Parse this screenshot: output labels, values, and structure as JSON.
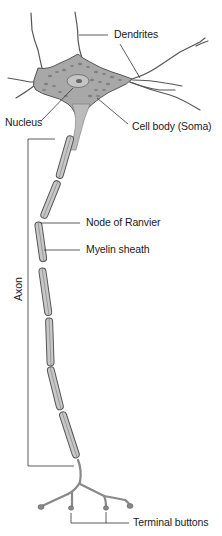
{
  "diagram": {
    "labels": {
      "dendrites": "Dendrites",
      "nucleus": "Nucleus",
      "cell_body": "Cell body (Soma)",
      "node_of_ranvier": "Node of Ranvier",
      "myelin_sheath": "Myelin sheath",
      "axon": "Axon",
      "terminal_buttons": "Terminal buttons"
    },
    "colors": {
      "outline": "#555555",
      "soma_fill": "#a8a8a8",
      "myelin_fill": "#c8c8c8",
      "leader_line": "#333333",
      "text": "#1a1a1a"
    }
  }
}
